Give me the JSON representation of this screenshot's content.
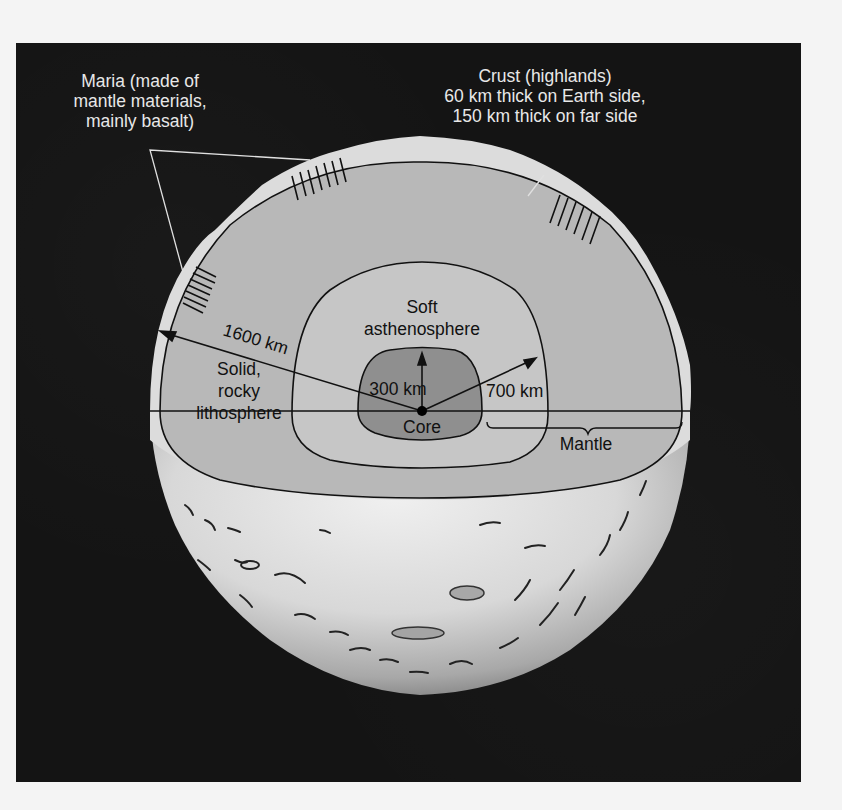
{
  "figure": {
    "background_color": "#141414",
    "page_color": "#f4f4f4"
  },
  "labels": {
    "maria": {
      "line1": "Maria (made of",
      "line2": "mantle materials,",
      "line3": "mainly basalt)"
    },
    "crust": {
      "line1": "Crust (highlands)",
      "line2": "60 km thick on Earth side,",
      "line3": "150 km thick on far side"
    },
    "asthenosphere": {
      "line1": "Soft",
      "line2": "asthenosphere"
    },
    "lithosphere": {
      "line1": "Solid,",
      "line2": "rocky",
      "line3": "lithosphere"
    },
    "core": "Core",
    "mantle": "Mantle",
    "radius_moon": "1600 km",
    "radius_core": "300 km",
    "radius_asthenosphere": "700 km"
  },
  "layers": [
    {
      "name": "Crust (highlands)",
      "color": "#d9d9d9"
    },
    {
      "name": "Solid, rocky lithosphere",
      "color": "#b4b4b4"
    },
    {
      "name": "Soft asthenosphere",
      "color": "#c2c2c2"
    },
    {
      "name": "Core",
      "color": "#8e8e8e"
    }
  ]
}
